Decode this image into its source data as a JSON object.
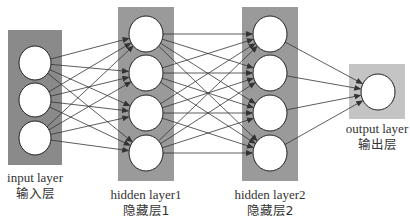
{
  "diagram": {
    "title": "",
    "layers": [
      {
        "id": "input",
        "label_en": "input layer",
        "label_zh": "输入层",
        "nodes": 3,
        "color": "#8a8a8a"
      },
      {
        "id": "hidden1",
        "label_en": "hidden layer1",
        "label_zh": "隐藏层1",
        "nodes": 4,
        "color": "#9a9a9a"
      },
      {
        "id": "hidden2",
        "label_en": "hidden layer2",
        "label_zh": "隐藏层2",
        "nodes": 4,
        "color": "#9a9a9a"
      },
      {
        "id": "output",
        "label_en": "output layer",
        "label_zh": "输出层",
        "nodes": 1,
        "color": "#c4c4c4"
      }
    ],
    "connections": "fully-connected",
    "edge_color": "#333333",
    "node_fill": "#ffffff"
  }
}
